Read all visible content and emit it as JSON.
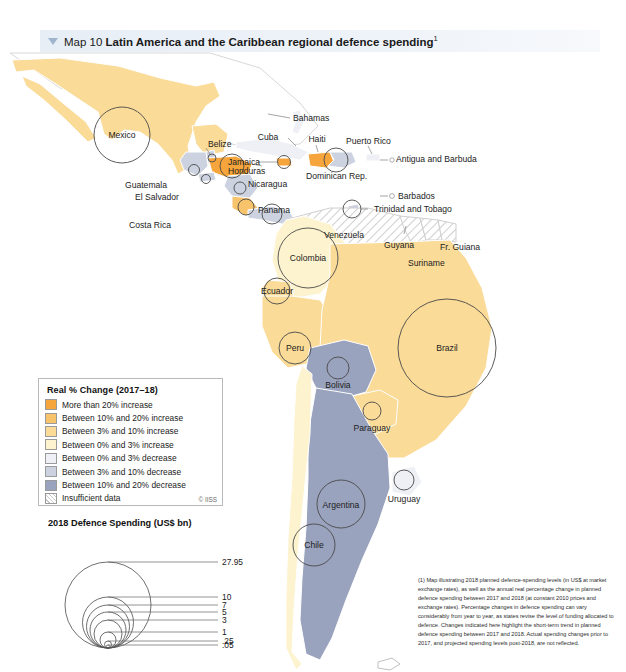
{
  "header": {
    "caret_icon": "triangle-down-icon",
    "map_number": "Map 10",
    "map_title": "Latin America and the Caribbean regional defence spending",
    "footnote_marker": "1"
  },
  "legend": {
    "title": "Real % Change (2017–18)",
    "credit": "© IISS",
    "items": [
      {
        "label": "More than 20% increase",
        "color": "#f5a53c",
        "hatch": false
      },
      {
        "label": "Between 10% and 20% increase",
        "color": "#f7c36b",
        "hatch": false
      },
      {
        "label": "Between 3% and 10% increase",
        "color": "#fadb98",
        "hatch": false
      },
      {
        "label": "Between 0% and 3% increase",
        "color": "#fdf3cf",
        "hatch": false
      },
      {
        "label": "Between 0% and 3% decrease",
        "color": "#eef0f5",
        "hatch": false
      },
      {
        "label": "Between 3% and 10% decrease",
        "color": "#ccd2e0",
        "hatch": false
      },
      {
        "label": "Between 10% and 20% decrease",
        "color": "#9aa3be",
        "hatch": false
      },
      {
        "label": "Insufficient data",
        "color": "#ffffff",
        "hatch": true
      }
    ]
  },
  "scale": {
    "title": "2018 Defence Spending (US$ bn)",
    "unit": "US$ bn",
    "values": [
      "27.95",
      "10",
      "7",
      "5",
      "3",
      "1",
      ".25",
      ".05"
    ]
  },
  "footnote": {
    "text": "(1) Map illustrating 2018 planned defence-spending levels (in US$ at market exchange rates), as well as the annual real percentage change in planned defence spending between 2017 and 2018 (at constant 2010 prices and exchange rates). Percentage changes in defence spending can vary considerably from year to year, as states revise the level of funding allocated to defence. Changes indicated here highlight the short-term trend in planned defence spending between 2017 and 2018. Actual spending changes prior to 2017, and projected spending levels post-2018, are not reflected."
  },
  "map": {
    "labels": [
      "Mexico",
      "Bahamas",
      "Cuba",
      "Haiti",
      "Puerto Rico",
      "Jamaica",
      "Dominican Rep.",
      "Antigua and Barbuda",
      "Belize",
      "Guatemala",
      "Honduras",
      "El Salvador",
      "Nicaragua",
      "Costa Rica",
      "Panama",
      "Barbados",
      "Trinidad and Tobago",
      "Venezuela",
      "Guyana",
      "Suriname",
      "Fr. Guiana",
      "Colombia",
      "Ecuador",
      "Peru",
      "Brazil",
      "Bolivia",
      "Paraguay",
      "Argentina",
      "Uruguay",
      "Chile"
    ]
  }
}
